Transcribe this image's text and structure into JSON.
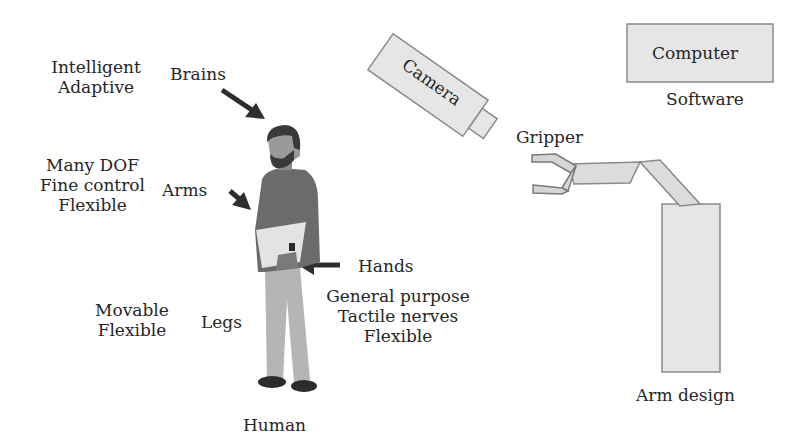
{
  "human": {
    "caption": "Human",
    "brains": {
      "label": "Brains",
      "traits": [
        "Intelligent",
        "Adaptive"
      ]
    },
    "arms": {
      "label": "Arms",
      "traits": [
        "Many DOF",
        "Fine control",
        "Flexible"
      ]
    },
    "hands": {
      "label": "Hands",
      "traits": [
        "General purpose",
        "Tactile nerves",
        "Flexible"
      ]
    },
    "legs": {
      "label": "Legs",
      "traits": [
        "Movable",
        "Flexible"
      ]
    }
  },
  "robot": {
    "camera": "Camera",
    "computer": "Computer",
    "software": "Software",
    "gripper": "Gripper",
    "caption": "Arm design"
  },
  "colors": {
    "shirt": "#6b6b6b",
    "pants": "#b5b5b5",
    "hair": "#3a3a3a",
    "skin": "#9a9a9a",
    "box_fill": "#e6e6e6",
    "box_stroke": "#8a8a8a",
    "arrow": "#2e2e2e"
  }
}
